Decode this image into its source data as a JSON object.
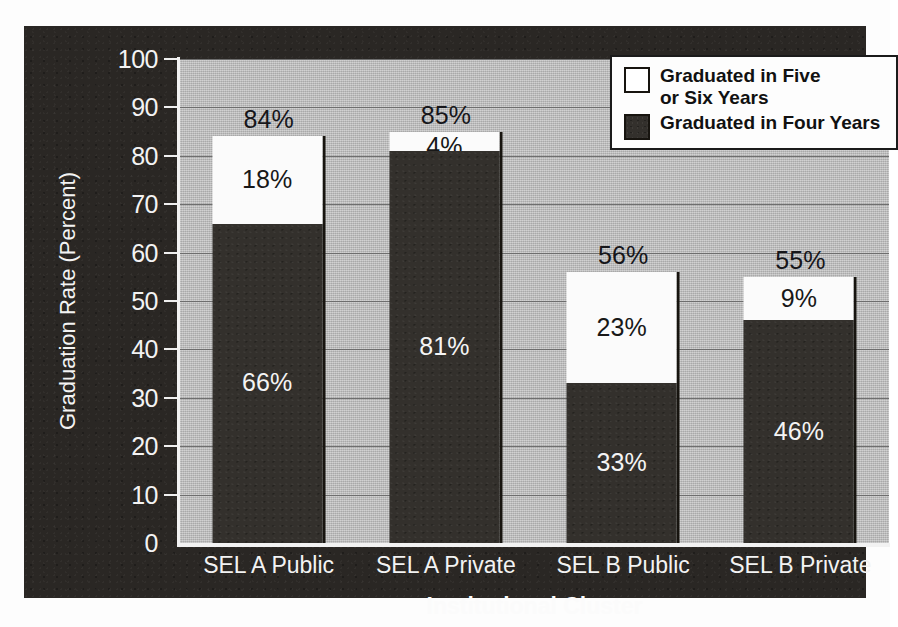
{
  "chart_data": {
    "type": "bar",
    "subtype": "stacked-bar",
    "title": "",
    "xlabel": "Institutional Cluster",
    "ylabel": "Graduation Rate (Percent)",
    "categories": [
      "SEL A Public",
      "SEL A Private",
      "SEL B Public",
      "SEL B Private"
    ],
    "series": [
      {
        "name": "Graduated in Four Years",
        "color": "#33302c",
        "values": [
          66,
          81,
          33,
          46
        ],
        "labels": [
          "66%",
          "81%",
          "33%",
          "46%"
        ]
      },
      {
        "name": "Graduated in Five or Six Years",
        "color": "#ffffff",
        "values": [
          18,
          4,
          23,
          9
        ],
        "labels": [
          "18%",
          "4%",
          "23%",
          "9%"
        ]
      }
    ],
    "totals": [
      84,
      85,
      56,
      55
    ],
    "total_labels": [
      "84%",
      "85%",
      "56%",
      "55%"
    ],
    "ylim": [
      0,
      100
    ],
    "yticks": [
      0,
      10,
      20,
      30,
      40,
      50,
      60,
      70,
      80,
      90,
      100
    ],
    "ytick_labels": [
      "0",
      "10",
      "20",
      "30",
      "40",
      "50",
      "60",
      "70",
      "80",
      "90",
      "100"
    ],
    "grid": true,
    "legend_position": "top-right",
    "legend_entries": [
      "Graduated in Five or Six Years",
      "Graduated in Four Years"
    ]
  },
  "legend": {
    "entries": [
      {
        "line1": "Graduated in Five",
        "line2": "or Six Years",
        "swatch": "white-swatch"
      },
      {
        "line1": "Graduated in Four Years",
        "line2": "",
        "swatch": "dark-swatch"
      }
    ]
  },
  "colors": {
    "panel_background": "#2a2724",
    "plot_background": "#b9b9b9",
    "gridline": "#6e6e6e",
    "bar_four_years": "#33302c",
    "bar_five_or_six_years": "#ffffff",
    "axis_line": "#f2f2f2",
    "dark_text": "#111111",
    "light_text": "#f3f3f3"
  }
}
